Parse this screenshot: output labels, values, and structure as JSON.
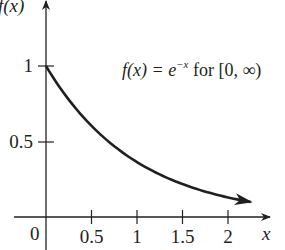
{
  "chart_data": {
    "type": "line",
    "title": "",
    "annotation": "f(x) = e^{-x} for [0, ∞)",
    "annotation_parts": {
      "lhs": "f(x) = e",
      "exponent": "−x",
      "rhs": " for [0, ∞)"
    },
    "xlabel": "x",
    "ylabel": "f(x)",
    "origin_label": "0",
    "xlim": [
      0,
      2.4
    ],
    "ylim": [
      0,
      1.4
    ],
    "x_ticks": [
      0.5,
      1,
      1.5,
      2
    ],
    "x_tick_labels": [
      "0.5",
      "1",
      "1.5",
      "2"
    ],
    "y_ticks": [
      0.5,
      1
    ],
    "y_tick_labels": [
      "0.5",
      "1"
    ],
    "grid": false,
    "legend": null,
    "series": [
      {
        "name": "f(x) = e^-x",
        "x": [
          0,
          0.25,
          0.5,
          0.75,
          1,
          1.25,
          1.5,
          1.75,
          2,
          2.25
        ],
        "y": [
          1,
          0.779,
          0.607,
          0.472,
          0.368,
          0.287,
          0.223,
          0.174,
          0.135,
          0.105
        ],
        "end_arrow": true
      }
    ],
    "colors": {
      "curve": "#231f20",
      "axes": "#231f20"
    }
  }
}
